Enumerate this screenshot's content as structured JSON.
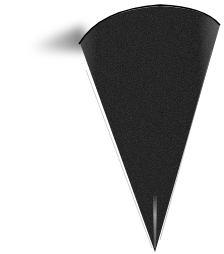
{
  "image": {
    "subject": "black cone pointing downward",
    "background_color": "#ffffff",
    "cone_color": "#141414",
    "highlight_color": "#bdbdbd",
    "shadow_streak": "motion blur shadow to the left of cone top"
  }
}
